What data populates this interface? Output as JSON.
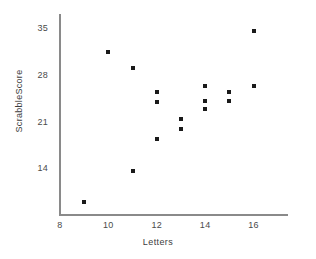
{
  "chart_data": {
    "type": "scatter",
    "title": "",
    "xlabel": "Letters",
    "ylabel": "ScrabbleScore",
    "xlim": [
      8,
      17.3
    ],
    "ylim": [
      7.2,
      37.2
    ],
    "grid": false,
    "legend": null,
    "xticks": [
      "8",
      "10",
      "12",
      "14",
      "16"
    ],
    "xtick_values": [
      8,
      10,
      12,
      14,
      16
    ],
    "yticks": [
      "14",
      "21",
      "28",
      "35"
    ],
    "ytick_values": [
      14,
      21,
      28,
      35
    ],
    "series": [
      {
        "name": "ScrabbleScore vs Letters",
        "marker": "square",
        "color": "#1a1a1a",
        "points": [
          {
            "x": 9,
            "y": 9.2
          },
          {
            "x": 10,
            "y": 31.5
          },
          {
            "x": 11,
            "y": 29.2
          },
          {
            "x": 11,
            "y": 13.7
          },
          {
            "x": 12,
            "y": 25.5
          },
          {
            "x": 12,
            "y": 24.0
          },
          {
            "x": 12,
            "y": 18.5
          },
          {
            "x": 13,
            "y": 21.5
          },
          {
            "x": 13,
            "y": 20.0
          },
          {
            "x": 14,
            "y": 26.5
          },
          {
            "x": 14,
            "y": 24.2
          },
          {
            "x": 14,
            "y": 23.0
          },
          {
            "x": 15,
            "y": 25.5
          },
          {
            "x": 15,
            "y": 24.2
          },
          {
            "x": 16,
            "y": 34.6
          },
          {
            "x": 16,
            "y": 26.5
          }
        ]
      }
    ]
  },
  "colors": {
    "marker": "#1a1a1a",
    "axis": "#8a8a8a",
    "tick_text": "#4a4a4a",
    "axis_title": "#3d3d3d",
    "background": "#ffffff"
  }
}
